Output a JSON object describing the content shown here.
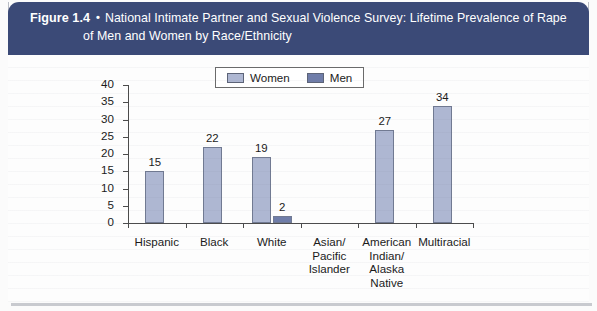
{
  "figure": {
    "number": "Figure 1.4",
    "bullet": "•",
    "title_line1": "National Intimate Partner and Sexual Violence Survey: Lifetime Prevalence of Rape",
    "title_line2": "of Men and Women by Race/Ethnicity"
  },
  "colors": {
    "header_band": "#3b4a77",
    "women_bar": "#aeb7d2",
    "men_bar": "#6f7da9",
    "bar_border": "#717a92",
    "axis": "#4b4b4b",
    "page": "#fdfdfd"
  },
  "chart_data": {
    "type": "bar",
    "title": "National Intimate Partner and Sexual Violence Survey: Lifetime Prevalence of Rape of Men and Women by Race/Ethnicity",
    "xlabel": "",
    "ylabel": "",
    "ylim": [
      0,
      40
    ],
    "yticks": [
      0,
      5,
      10,
      15,
      20,
      25,
      30,
      35,
      40
    ],
    "grid": false,
    "legend_position": "top-center",
    "categories": [
      "Hispanic",
      "Black",
      "White",
      "Asian/\nPacific\nIslander",
      "American\nIndian/\nAlaska\nNative",
      "Multiracial"
    ],
    "series": [
      {
        "name": "Women",
        "values": [
          15,
          22,
          19,
          null,
          27,
          34
        ],
        "labels": [
          "15",
          "22",
          "19",
          "",
          "27",
          "34"
        ]
      },
      {
        "name": "Men",
        "values": [
          null,
          null,
          2,
          null,
          null,
          null
        ],
        "labels": [
          "",
          "",
          "2",
          "",
          "",
          ""
        ]
      }
    ]
  }
}
